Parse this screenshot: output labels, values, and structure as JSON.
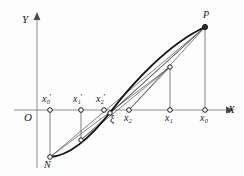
{
  "figure": {
    "kind": "geometric-diagram",
    "background_color": "#fdfdfd",
    "ink_color": "#1a1a1a",
    "width": 244,
    "height": 176
  },
  "axes": {
    "x_label": "X",
    "y_label": "Y",
    "origin_label": "O",
    "x_axis_y": 110,
    "y_axis_x": 37,
    "x_axis_start": 14,
    "x_axis_end": 232,
    "y_axis_top": 14,
    "y_axis_bottom": 168
  },
  "curve_points": {
    "N": {
      "label": "N",
      "x": 50,
      "y": 157
    },
    "P": {
      "label": "P",
      "x": 205,
      "y": 27
    },
    "c1": {
      "x": 81,
      "y": 140
    },
    "c2": {
      "x": 110,
      "y": 113
    },
    "c3": {
      "x": 170,
      "y": 67
    }
  },
  "axis_points": [
    {
      "name": "x0-prime",
      "base": "x",
      "sub": "0",
      "prime": true,
      "x": 50,
      "label_side": "above"
    },
    {
      "name": "x1-prime",
      "base": "x",
      "sub": "1",
      "prime": true,
      "x": 81,
      "label_side": "above"
    },
    {
      "name": "x2-prime",
      "base": "x",
      "sub": "2",
      "prime": true,
      "x": 104,
      "label_side": "above"
    },
    {
      "name": "xi",
      "base": "ξ",
      "sub": "",
      "prime": false,
      "x": 112,
      "label_side": "below"
    },
    {
      "name": "x2",
      "base": "x",
      "sub": "2",
      "prime": false,
      "x": 129,
      "label_side": "below"
    },
    {
      "name": "x1",
      "base": "x",
      "sub": "1",
      "prime": false,
      "x": 170,
      "label_side": "below"
    },
    {
      "name": "x0",
      "base": "x",
      "sub": "0",
      "prime": false,
      "x": 205,
      "label_side": "below"
    }
  ],
  "labels": {
    "x_axis": "X",
    "y_axis": "Y",
    "origin": "O",
    "point_N": "N",
    "point_P": "P",
    "xi": "ξ",
    "x0_prime": "x",
    "x1_prime": "x",
    "x2_prime": "x",
    "x2": "x",
    "x1": "x",
    "x0": "x",
    "sub_0": "0",
    "sub_1": "1",
    "sub_2": "2",
    "prime_mark": "′"
  },
  "style": {
    "curve_stroke_width": 1.9,
    "chord_stroke_width": 0.7,
    "axis_stroke_width": 1.0,
    "marker_radius": 2.3,
    "marker_fill": "#fdfdfd",
    "marker_stroke": "#1a1a1a"
  }
}
